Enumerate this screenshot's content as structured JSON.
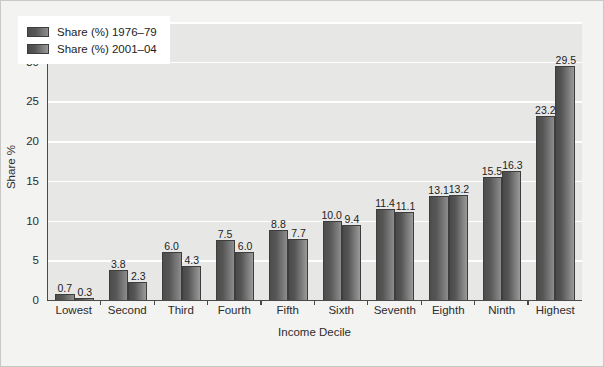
{
  "chart_data": {
    "type": "bar",
    "title": "",
    "xlabel": "Income Decile",
    "ylabel": "Share %",
    "ylim": [
      0,
      35
    ],
    "yticks": [
      0,
      5,
      10,
      15,
      20,
      25,
      30,
      35
    ],
    "grid": "horizontal",
    "legend_position": "upper-left",
    "categories": [
      "Lowest",
      "Second",
      "Third",
      "Fourth",
      "Fifth",
      "Sixth",
      "Seventh",
      "Eighth",
      "Ninth",
      "Highest"
    ],
    "series": [
      {
        "name": "Share (%) 1976–79",
        "color": "#555555",
        "values": [
          0.7,
          3.8,
          6.0,
          7.5,
          8.8,
          10.0,
          11.4,
          13.1,
          15.5,
          23.2
        ],
        "labels": [
          "0.7",
          "3.8",
          "6.0",
          "7.5",
          "8.8",
          "10.0",
          "11.4",
          "13.1",
          "15.5",
          "23.2"
        ]
      },
      {
        "name": "Share (%) 2001–04",
        "color": "#5a5a5a",
        "values": [
          0.3,
          2.3,
          4.3,
          6.0,
          7.7,
          9.4,
          11.1,
          13.2,
          16.3,
          29.5
        ],
        "labels": [
          "0.3",
          "2.3",
          "4.3",
          "6.0",
          "7.7",
          "9.4",
          "11.1",
          "13.2",
          "16.3",
          "29.5"
        ]
      }
    ]
  },
  "colors": {
    "plot_background": "#e7e7e6",
    "figure_background": "#f3f3f2",
    "gridline": "#ffffff",
    "axis": "#4a4a4a",
    "text": "#2c2c2c"
  }
}
